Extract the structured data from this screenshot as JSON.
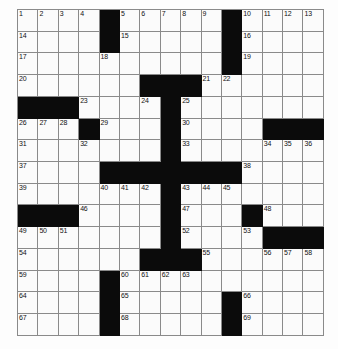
{
  "puzzle": {
    "type": "crossword-grid",
    "title": "Crossword Puzzle Grid",
    "rows": 15,
    "columns": 15,
    "cell_size_px": 20.4,
    "colors": {
      "block": "#0b0b0b",
      "open": "#fbfbfb",
      "grid_line": "#8a8a8a",
      "number_text": "#111111",
      "page_background": "#ffffff"
    },
    "max_clue_number": 69,
    "grid": [
      [
        "1",
        "2",
        "3",
        "4",
        "#",
        "5",
        "6",
        "7",
        "8",
        "9",
        "#",
        "10",
        "11",
        "12",
        "13"
      ],
      [
        "14",
        "",
        "",
        "",
        "#",
        "15",
        "",
        "",
        "",
        "",
        "#",
        "16",
        "",
        "",
        ""
      ],
      [
        "17",
        "",
        "",
        "",
        "18",
        "",
        "",
        "",
        "",
        "",
        "#",
        "19",
        "",
        "",
        ""
      ],
      [
        "20",
        "",
        "",
        "",
        "",
        "",
        "#",
        "#",
        "#",
        "21",
        "22",
        "",
        "",
        "",
        ""
      ],
      [
        "#",
        "#",
        "#",
        "23",
        "",
        "",
        "24",
        "#",
        "25",
        "",
        "",
        "",
        "",
        "",
        ""
      ],
      [
        "26",
        "27",
        "28",
        "#",
        "29",
        "",
        "",
        "#",
        "30",
        "",
        "",
        "",
        "#",
        "#",
        "#"
      ],
      [
        "31",
        "",
        "",
        "32",
        "",
        "",
        "",
        "#",
        "33",
        "",
        "",
        "",
        "34",
        "35",
        "36"
      ],
      [
        "37",
        "",
        "",
        "",
        "#",
        "#",
        "#",
        "#",
        "#",
        "#",
        "#",
        "38",
        "",
        "",
        ""
      ],
      [
        "39",
        "",
        "",
        "",
        "40",
        "41",
        "42",
        "#",
        "43",
        "44",
        "45",
        "",
        "",
        "",
        ""
      ],
      [
        "#",
        "#",
        "#",
        "46",
        "",
        "",
        "",
        "#",
        "47",
        "",
        "",
        "#",
        "48",
        "",
        ""
      ],
      [
        "49",
        "50",
        "51",
        "",
        "",
        "",
        "",
        "#",
        "52",
        "",
        "",
        "53",
        "#",
        "#",
        "#"
      ],
      [
        "54",
        "",
        "",
        "",
        "",
        "",
        "#",
        "#",
        "#",
        "55",
        "",
        "",
        "56",
        "57",
        "58"
      ],
      [
        "59",
        "",
        "",
        "",
        "#",
        "60",
        "61",
        "62",
        "63",
        "",
        "",
        "",
        "",
        "",
        ""
      ],
      [
        "64",
        "",
        "",
        "",
        "#",
        "65",
        "",
        "",
        "",
        "",
        "#",
        "66",
        "",
        "",
        ""
      ],
      [
        "67",
        "",
        "",
        "",
        "#",
        "68",
        "",
        "",
        "",
        "",
        "#",
        "69",
        "",
        "",
        ""
      ]
    ],
    "across_numbers": [
      1,
      5,
      10,
      14,
      15,
      16,
      17,
      19,
      20,
      21,
      23,
      25,
      26,
      29,
      30,
      31,
      33,
      34,
      37,
      38,
      39,
      43,
      46,
      47,
      48,
      49,
      52,
      54,
      55,
      56,
      59,
      60,
      64,
      65,
      66,
      67,
      68,
      69
    ],
    "down_numbers": [
      1,
      2,
      3,
      4,
      5,
      6,
      7,
      8,
      9,
      10,
      11,
      12,
      13,
      18,
      21,
      22,
      24,
      25,
      27,
      28,
      32,
      34,
      35,
      36,
      40,
      41,
      42,
      44,
      45,
      50,
      51,
      53,
      57,
      58,
      61,
      62,
      63
    ]
  }
}
